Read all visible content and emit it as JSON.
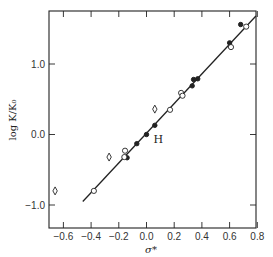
{
  "chart_data": {
    "type": "scatter",
    "title": "",
    "xlabel": "σ*",
    "ylabel": "log K/K₀",
    "xlim": [
      -0.7,
      0.79
    ],
    "ylim": [
      -1.33,
      1.75
    ],
    "grid": false,
    "legend": null,
    "xticks": [
      -0.6,
      -0.4,
      -0.2,
      0.0,
      0.2,
      0.4,
      0.6,
      0.8
    ],
    "xtick_labels": [
      "−0.6",
      "−0.4",
      "−0.2",
      "0.0",
      "0.2",
      "0.4",
      "0.6",
      "0.8"
    ],
    "yticks": [
      -1.0,
      0.0,
      1.0
    ],
    "ytick_labels": [
      "−1.0",
      "0.0",
      "1.0"
    ],
    "annotations": [
      {
        "text": "H",
        "x": 0.05,
        "y": -0.07
      }
    ],
    "fit_line": {
      "x": [
        -0.46,
        0.79
      ],
      "y": [
        -0.95,
        1.68
      ]
    },
    "series": [
      {
        "name": "filled circles",
        "marker": "filled-circle",
        "points": [
          {
            "x": -0.14,
            "y": -0.33
          },
          {
            "x": -0.07,
            "y": -0.13
          },
          {
            "x": 0.0,
            "y": 0.0
          },
          {
            "x": 0.06,
            "y": 0.13
          },
          {
            "x": 0.33,
            "y": 0.69
          },
          {
            "x": 0.34,
            "y": 0.78
          },
          {
            "x": 0.37,
            "y": 0.79
          },
          {
            "x": 0.6,
            "y": 1.3
          },
          {
            "x": 0.68,
            "y": 1.56
          }
        ]
      },
      {
        "name": "open circles",
        "marker": "open-circle",
        "points": [
          {
            "x": -0.38,
            "y": -0.8
          },
          {
            "x": -0.155,
            "y": -0.23
          },
          {
            "x": -0.16,
            "y": -0.32
          },
          {
            "x": 0.17,
            "y": 0.35
          },
          {
            "x": 0.25,
            "y": 0.59
          },
          {
            "x": 0.26,
            "y": 0.55
          },
          {
            "x": 0.61,
            "y": 1.24
          },
          {
            "x": 0.72,
            "y": 1.53
          }
        ]
      },
      {
        "name": "open diamonds",
        "marker": "open-diamond",
        "points": [
          {
            "x": -0.66,
            "y": -0.8
          },
          {
            "x": -0.27,
            "y": -0.32
          },
          {
            "x": 0.06,
            "y": 0.36
          }
        ]
      }
    ]
  }
}
